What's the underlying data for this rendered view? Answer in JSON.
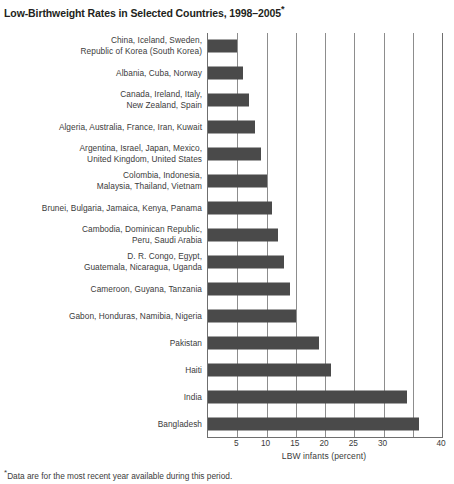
{
  "title": {
    "text": "Low-Birthweight Rates in Selected Countries, 1998–2005",
    "footnote_marker": "*"
  },
  "footnote": {
    "marker": "*",
    "text": "Data are for the most recent year available during this period."
  },
  "colors": {
    "bar": "#4a4a4a",
    "gridline": "#8d8d8d",
    "axis": "#6f6f6f",
    "text": "#3b3b3b",
    "title": "#231f20",
    "background": "#ffffff"
  },
  "chart_data": {
    "type": "bar",
    "orientation": "horizontal",
    "title": "Low-Birthweight Rates in Selected Countries, 1998–2005*",
    "xlabel": "LBW infants (percent)",
    "ylabel": "",
    "xlim": [
      0,
      40
    ],
    "xticks": [
      0,
      5,
      10,
      15,
      20,
      25,
      30,
      35,
      40
    ],
    "xtick_labels": [
      "",
      "5",
      "10",
      "15",
      "20",
      "25",
      "30",
      "",
      "40"
    ],
    "grid": true,
    "legend": null,
    "categories": [
      "China, Iceland, Sweden,\nRepublic of Korea (South Korea)",
      "Albania, Cuba, Norway",
      "Canada, Ireland, Italy,\nNew Zealand, Spain",
      "Algeria, Australia, France, Iran, Kuwait",
      "Argentina, Israel, Japan, Mexico,\nUnited Kingdom, United States",
      "Colombia, Indonesia,\nMalaysia, Thailand, Vietnam",
      "Brunei, Bulgaria, Jamaica, Kenya, Panama",
      "Cambodia, Dominican Republic,\nPeru, Saudi Arabia",
      "D. R. Congo, Egypt,\nGuatemala, Nicaragua, Uganda",
      "Cameroon, Guyana, Tanzania",
      "Gabon, Honduras, Namibia, Nigeria",
      "Pakistan",
      "Haiti",
      "India",
      "Bangladesh"
    ],
    "values": [
      5,
      6,
      7,
      8,
      9,
      10,
      11,
      12,
      13,
      14,
      15,
      19,
      21,
      34,
      36
    ]
  }
}
